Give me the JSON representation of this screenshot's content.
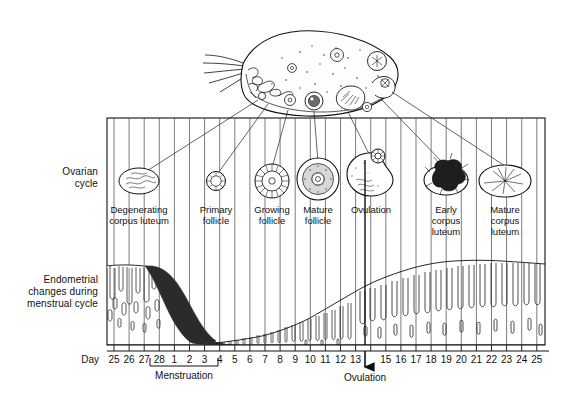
{
  "row_labels": {
    "ovarian": "Ovarian\ncycle",
    "ovarian_line1": "Ovarian",
    "ovarian_line2": "cycle",
    "endometrial_line1": "Endometrial",
    "endometrial_line2": "changes during",
    "endometrial_line3": "menstrual cycle"
  },
  "axis": {
    "day_label": "Day",
    "ticks": [
      "25",
      "26",
      "27",
      "28",
      "1",
      "2",
      "3",
      "4",
      "5",
      "6",
      "7",
      "8",
      "9",
      "10",
      "11",
      "12",
      "13",
      "",
      "15",
      "16",
      "17",
      "18",
      "19",
      "20",
      "21",
      "22",
      "23",
      "24",
      "25"
    ],
    "ovulation_tick_index": 17
  },
  "annotations": {
    "menstruation": "Menstruation",
    "ovulation": "Ovulation"
  },
  "ovarian_structures": [
    {
      "name": "degenerating-corpus-luteum",
      "label_line1": "Degenerating",
      "label_line2": "corpus luteum",
      "label_line3": ""
    },
    {
      "name": "primary-follicle",
      "label_line1": "Primary",
      "label_line2": "follicle",
      "label_line3": ""
    },
    {
      "name": "growing-follicle",
      "label_line1": "Growing",
      "label_line2": "follicle",
      "label_line3": ""
    },
    {
      "name": "mature-follicle",
      "label_line1": "Mature",
      "label_line2": "follicle",
      "label_line3": ""
    },
    {
      "name": "ovulation-structure",
      "label_line1": "Ovulation",
      "label_line2": "",
      "label_line3": ""
    },
    {
      "name": "early-corpus-luteum",
      "label_line1": "Early",
      "label_line2": "corpus",
      "label_line3": "luteum"
    },
    {
      "name": "mature-corpus-luteum",
      "label_line1": "Mature",
      "label_line2": "corpus",
      "label_line3": "luteum"
    }
  ],
  "chart_data": {
    "type": "line",
    "xlabel": "Day",
    "ylabel": "Endometrial thickness",
    "categories": [
      "25",
      "26",
      "27",
      "28",
      "1",
      "2",
      "3",
      "4",
      "5",
      "6",
      "7",
      "8",
      "9",
      "10",
      "11",
      "12",
      "13",
      "14",
      "15",
      "16",
      "17",
      "18",
      "19",
      "20",
      "21",
      "22",
      "23",
      "24",
      "25"
    ],
    "series": [
      {
        "name": "Endometrial thickness (relative)",
        "values": [
          88,
          88,
          86,
          84,
          70,
          48,
          26,
          8,
          5,
          8,
          12,
          17,
          22,
          28,
          34,
          40,
          46,
          52,
          58,
          64,
          70,
          75,
          80,
          84,
          87,
          89,
          90,
          90,
          89
        ]
      }
    ],
    "phases": [
      {
        "name": "menstruation",
        "label": "Menstruation",
        "start_day": "28",
        "end_day": "4"
      },
      {
        "name": "ovulation",
        "label": "Ovulation",
        "day": "14"
      }
    ],
    "grid": true,
    "legend": "none"
  },
  "colors": {
    "ink": "#111111",
    "shed_tissue": "#2b2b2b",
    "background": "#ffffff",
    "grid": "#5a5a5a"
  }
}
